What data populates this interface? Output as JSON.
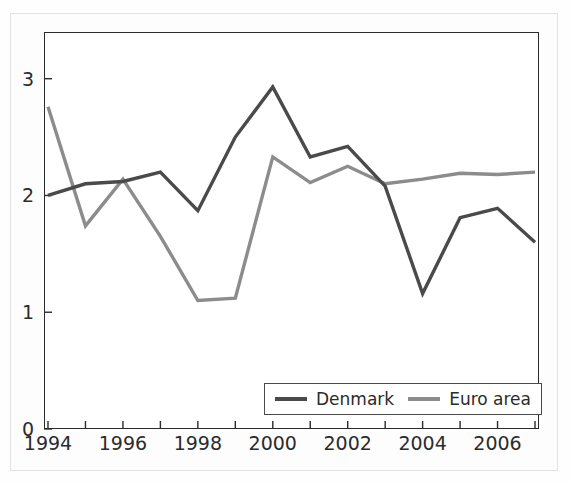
{
  "chart_data": {
    "type": "line",
    "title": "",
    "subtitle": "",
    "xlabel": "",
    "ylabel": "",
    "x": [
      1994,
      1995,
      1996,
      1997,
      1998,
      1999,
      2000,
      2001,
      2002,
      2003,
      2004,
      2005,
      2006,
      2007
    ],
    "xlim": [
      1994,
      2007
    ],
    "ylim": [
      0,
      3.4
    ],
    "xticks": [
      1994,
      1995,
      1996,
      1997,
      1998,
      1999,
      2000,
      2001,
      2002,
      2003,
      2004,
      2005,
      2006,
      2007
    ],
    "xtick_labels": [
      "1994",
      "",
      "1996",
      "",
      "1998",
      "",
      "2000",
      "",
      "2002",
      "",
      "2004",
      "",
      "2006",
      ""
    ],
    "yticks": [
      0,
      1,
      2,
      3
    ],
    "ytick_labels": [
      "0",
      "1",
      "2",
      "3"
    ],
    "grid": false,
    "legend_position": "bottom-right",
    "series": [
      {
        "name": "Denmark",
        "color": "#4a4a4a",
        "values": [
          2.0,
          2.1,
          2.12,
          2.2,
          1.87,
          2.5,
          2.93,
          2.33,
          2.42,
          2.08,
          1.16,
          1.81,
          1.89,
          1.6
        ]
      },
      {
        "name": "Euro area",
        "color": "#8c8c8c",
        "values": [
          2.76,
          1.74,
          2.14,
          1.65,
          1.1,
          1.12,
          2.33,
          2.11,
          2.25,
          2.1,
          2.14,
          2.19,
          2.18,
          2.2
        ]
      }
    ]
  },
  "legend": {
    "entries": [
      {
        "label": "Denmark",
        "color": "#4a4a4a"
      },
      {
        "label": "Euro area",
        "color": "#8c8c8c"
      }
    ]
  },
  "axes": {
    "y_axis_name": "y-axis",
    "x_axis_name": "x-axis"
  }
}
